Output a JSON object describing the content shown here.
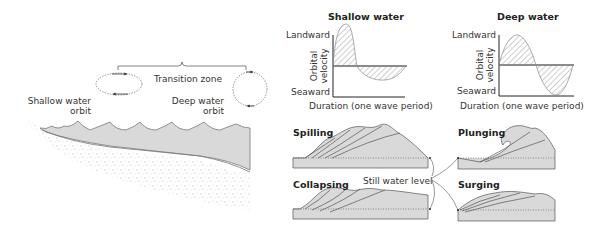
{
  "left_panel": {
    "transition_zone": "Transition zone",
    "shallow_orbit_line1": "Shallow water",
    "shallow_orbit_line2": "orbit",
    "deep_orbit_line1": "Deep water",
    "deep_orbit_line2": "orbit"
  },
  "velocity_charts": [
    {
      "title": "Shallow water",
      "y_top": "Landward",
      "y_bottom": "Seaward",
      "y_axis_line1": "Orbital",
      "y_axis_line2": "velocity",
      "x_axis": "Duration (one wave period)"
    },
    {
      "title": "Deep water",
      "y_top": "Landward",
      "y_bottom": "Seaward",
      "y_axis_line1": "Orbital",
      "y_axis_line2": "velocity",
      "x_axis": "Duration (one wave period)"
    }
  ],
  "breakers": {
    "spilling": "Spilling",
    "plunging": "Plunging",
    "collapsing": "Collapsing",
    "surging": "Surging",
    "still_water_level": "Still water level"
  },
  "colors": {
    "water_fill": "#d9d9d9",
    "line": "#555555",
    "text": "#333333"
  }
}
